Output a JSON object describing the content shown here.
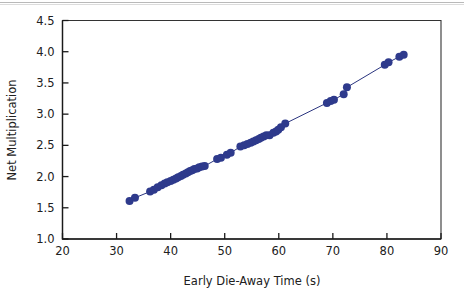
{
  "chart_data": {
    "type": "scatter",
    "title": "",
    "xlabel": "Early Die-Away Time (s)",
    "ylabel": "Net Multiplication",
    "xlim": [
      20,
      90
    ],
    "ylim": [
      1.0,
      4.5
    ],
    "xticks": [
      20,
      30,
      40,
      50,
      60,
      70,
      80,
      90
    ],
    "yticks": [
      1.0,
      1.5,
      2.0,
      2.5,
      3.0,
      3.5,
      4.0,
      4.5
    ],
    "xtick_labels": [
      "20",
      "30",
      "40",
      "50",
      "60",
      "70",
      "80",
      "90"
    ],
    "ytick_labels": [
      "1.0",
      "1.5",
      "2.0",
      "2.5",
      "3.0",
      "3.5",
      "4.0",
      "4.5"
    ],
    "grid": false,
    "legend": null,
    "marker_color": "#2e3a8c",
    "line_color": "#2b357f",
    "marker_size": 8,
    "connected": true,
    "series": [
      {
        "name": "Net multiplication vs early die-away time",
        "x": [
          32.4,
          33.4,
          36.2,
          36.9,
          37.6,
          38.3,
          38.9,
          39.4,
          40.0,
          40.5,
          41.0,
          41.4,
          41.9,
          42.3,
          42.8,
          43.2,
          43.6,
          44.0,
          44.4,
          44.9,
          45.3,
          45.8,
          46.3,
          48.6,
          49.3,
          50.4,
          51.1,
          52.9,
          53.6,
          54.2,
          54.8,
          55.3,
          55.8,
          56.3,
          56.7,
          57.2,
          57.7,
          58.3,
          59.0,
          59.5,
          59.9,
          60.4,
          61.2,
          68.9,
          69.6,
          70.2,
          72.0,
          72.6,
          79.6,
          80.3,
          82.3,
          83.1
        ],
        "y": [
          1.61,
          1.66,
          1.76,
          1.79,
          1.83,
          1.86,
          1.89,
          1.91,
          1.93,
          1.95,
          1.97,
          1.99,
          2.01,
          2.03,
          2.05,
          2.07,
          2.09,
          2.1,
          2.12,
          2.13,
          2.15,
          2.16,
          2.17,
          2.28,
          2.3,
          2.35,
          2.38,
          2.48,
          2.5,
          2.52,
          2.54,
          2.56,
          2.58,
          2.6,
          2.62,
          2.64,
          2.66,
          2.66,
          2.7,
          2.72,
          2.75,
          2.79,
          2.85,
          3.18,
          3.21,
          3.23,
          3.32,
          3.43,
          3.79,
          3.83,
          3.92,
          3.95
        ]
      }
    ]
  },
  "page": {
    "background": "#ffffff"
  }
}
